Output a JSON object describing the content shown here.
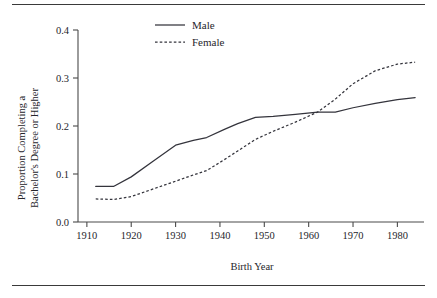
{
  "chart_data": {
    "type": "line",
    "title": "",
    "xlabel": "Birth Year",
    "ylabel": "Proportion Completing a Bachelor's Degree or Higher",
    "ylabel_line1": "Proportion Completing a",
    "ylabel_line2": "Bachelor's Degree or Higher",
    "xlim": [
      1908,
      1986
    ],
    "ylim": [
      0.0,
      0.4
    ],
    "xticks": [
      1910,
      1920,
      1930,
      1940,
      1950,
      1960,
      1970,
      1980
    ],
    "xtick_labels": [
      "1910",
      "1920",
      "1930",
      "1940",
      "1950",
      "1960",
      "1970",
      "1980"
    ],
    "yticks": [
      0.0,
      0.1,
      0.2,
      0.3,
      0.4
    ],
    "ytick_labels": [
      "0.0",
      "0.1",
      "0.2",
      "0.3",
      "0.4"
    ],
    "grid": false,
    "legend_position": "top-center",
    "series": [
      {
        "name": "Male",
        "style": "solid",
        "color": "#34343c",
        "x": [
          1912,
          1916,
          1920,
          1925,
          1930,
          1934,
          1937,
          1941,
          1944,
          1948,
          1952,
          1957,
          1962,
          1966,
          1970,
          1975,
          1980,
          1984
        ],
        "values": [
          0.074,
          0.074,
          0.094,
          0.127,
          0.16,
          0.17,
          0.176,
          0.193,
          0.205,
          0.218,
          0.22,
          0.224,
          0.229,
          0.229,
          0.238,
          0.247,
          0.255,
          0.259
        ]
      },
      {
        "name": "Female",
        "style": "dashed",
        "color": "#34343c",
        "x": [
          1912,
          1916,
          1920,
          1925,
          1930,
          1934,
          1937,
          1941,
          1944,
          1948,
          1952,
          1957,
          1962,
          1966,
          1970,
          1975,
          1980,
          1984
        ],
        "values": [
          0.048,
          0.047,
          0.053,
          0.069,
          0.085,
          0.098,
          0.107,
          0.13,
          0.148,
          0.172,
          0.189,
          0.208,
          0.229,
          0.256,
          0.288,
          0.315,
          0.329,
          0.333
        ]
      }
    ],
    "legend": [
      {
        "label": "Male",
        "style": "solid"
      },
      {
        "label": "Female",
        "style": "dashed"
      }
    ]
  }
}
